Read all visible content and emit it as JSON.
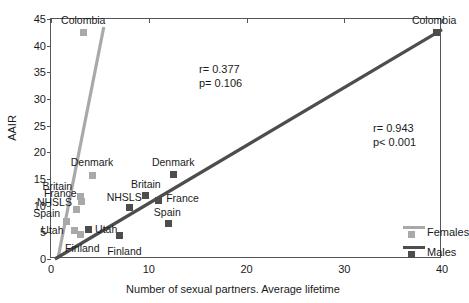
{
  "chart_data": {
    "type": "scatter",
    "title": "",
    "xlabel": "Number of sexual partners. Average lifetime",
    "ylabel": "AAIR",
    "xlim": [
      0,
      40
    ],
    "ylim": [
      0,
      45
    ],
    "xticks": [
      "0",
      "10",
      "20",
      "30",
      "40"
    ],
    "xtick_values": [
      0,
      10,
      20,
      30,
      40
    ],
    "yticks": [
      "0",
      "5",
      "10",
      "15",
      "20",
      "25",
      "30",
      "35",
      "40",
      "45"
    ],
    "ytick_values": [
      0,
      5,
      10,
      15,
      20,
      25,
      30,
      35,
      40,
      45
    ],
    "grid": false,
    "legend_position": "right-bottom",
    "series": [
      {
        "name": "Females",
        "color": "#a9a9a9",
        "stats": {
          "r_label": "r= 0.377",
          "p_label": "p= 0.106",
          "r": 0.377,
          "p": 0.106
        },
        "points": [
          {
            "label": "Colombia",
            "x": 3.3,
            "y": 42.4,
            "label_dx": 0,
            "label_dy": -13
          },
          {
            "label": "Denmark",
            "x": 4.2,
            "y": 15.7,
            "label_dx": 0,
            "label_dy": -13
          },
          {
            "label": "Britain",
            "x": 3.0,
            "y": 11.8,
            "label_dx": -23,
            "label_dy": -10
          },
          {
            "label": "France",
            "x": 3.1,
            "y": 10.7,
            "label_dx": -21,
            "label_dy": -9
          },
          {
            "label": "NHSLS",
            "x": 2.6,
            "y": 9.2,
            "label_dx": -22,
            "label_dy": -8
          },
          {
            "label": "Spain",
            "x": 1.6,
            "y": 7.0,
            "label_dx": -20,
            "label_dy": -9
          },
          {
            "label": "Utah",
            "x": 2.4,
            "y": 5.4,
            "label_dx": -22,
            "label_dy": 0
          },
          {
            "label": "Finland",
            "x": 3.0,
            "y": 4.6,
            "label_dx": 2,
            "label_dy": 14
          }
        ],
        "line": {
          "x1": 0.7,
          "y1": 0.0,
          "x2": 5.4,
          "y2": 43.5
        }
      },
      {
        "name": "Males",
        "color": "#4d4d4d",
        "stats": {
          "r_label": "r= 0.943",
          "p_label": "p< 0.001",
          "r": 0.943,
          "p": 0.001
        },
        "points": [
          {
            "label": "Colombia",
            "x": 39.4,
            "y": 42.4,
            "label_dx": -2,
            "label_dy": -13
          },
          {
            "label": "Denmark",
            "x": 12.5,
            "y": 15.8,
            "label_dx": 0,
            "label_dy": -13
          },
          {
            "label": "Britain",
            "x": 9.7,
            "y": 11.9,
            "label_dx": 0,
            "label_dy": -12
          },
          {
            "label": "France",
            "x": 11.0,
            "y": 10.9,
            "label_dx": 24,
            "label_dy": -3
          },
          {
            "label": "NHSLS",
            "x": 8.0,
            "y": 9.6,
            "label_dx": -5,
            "label_dy": -11
          },
          {
            "label": "Spain",
            "x": 12.0,
            "y": 6.6,
            "label_dx": -1,
            "label_dy": -12
          },
          {
            "label": "Utah",
            "x": 3.8,
            "y": 5.6,
            "label_dx": 18,
            "label_dy": 0
          },
          {
            "label": "Finland",
            "x": 7.0,
            "y": 4.4,
            "label_dx": 5,
            "label_dy": 15
          }
        ],
        "line": {
          "x1": 0.4,
          "y1": 0.0,
          "x2": 40.0,
          "y2": 43.0
        }
      }
    ]
  },
  "legend": {
    "items": [
      {
        "label": "Females",
        "color": "#a9a9a9"
      },
      {
        "label": "Males",
        "color": "#4d4d4d"
      }
    ]
  }
}
